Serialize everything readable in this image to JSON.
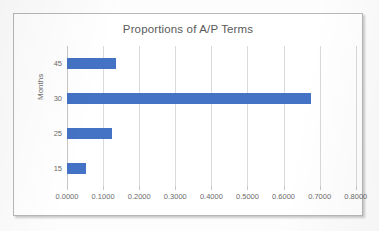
{
  "chart_data": {
    "type": "bar",
    "orientation": "horizontal",
    "title": "Proportions of A/P Terms",
    "xlabel": "",
    "ylabel": "Months",
    "categories": [
      "45",
      "30",
      "25",
      "15"
    ],
    "values": [
      0.135,
      0.675,
      0.125,
      0.053
    ],
    "xlim": [
      0.0,
      0.8
    ],
    "xticks": [
      "0.0000",
      "0.1000",
      "0.2000",
      "0.3000",
      "0.4000",
      "0.5000",
      "0.6000",
      "0.7000",
      "0.8000"
    ],
    "xtick_values": [
      0.0,
      0.1,
      0.2,
      0.3,
      0.4,
      0.5,
      0.6,
      0.7,
      0.8
    ],
    "grid": true,
    "grid_axis": "x",
    "legend": false,
    "series": [
      {
        "name": "Proportion",
        "color": "#4472C4",
        "values": [
          0.135,
          0.675,
          0.125,
          0.053
        ]
      }
    ]
  },
  "chart": {
    "title": "Proportions of A/P Terms",
    "y_axis_title": "Months",
    "bar_color": "#4472C4",
    "gridline_color": "#D9D9D9",
    "text_color": "#5A5A5A",
    "frame_color": "#B7B7B7"
  }
}
